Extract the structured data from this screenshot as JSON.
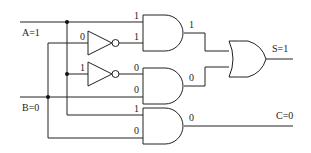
{
  "diagram": {
    "type": "logic-circuit",
    "inputs": {
      "a": "A=1",
      "b": "B=0"
    },
    "outputs": {
      "s": "S=1",
      "c": "C=0"
    },
    "signal_labels": {
      "and1_in_top": "1",
      "not1_in": "0",
      "not1_out": "1",
      "and1_out": "1",
      "not2_in": "1",
      "not2_out": "0",
      "and2_in_bottom": "0",
      "and2_out": "0",
      "and3_in_top": "1",
      "and3_in_bottom": "0",
      "and3_out": "0"
    },
    "gates": [
      {
        "id": "not1",
        "kind": "NOT"
      },
      {
        "id": "not2",
        "kind": "NOT"
      },
      {
        "id": "and1",
        "kind": "AND"
      },
      {
        "id": "and2",
        "kind": "AND"
      },
      {
        "id": "and3",
        "kind": "AND"
      },
      {
        "id": "or1",
        "kind": "OR"
      }
    ]
  }
}
